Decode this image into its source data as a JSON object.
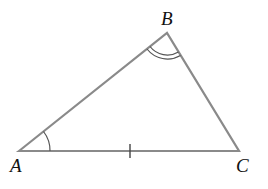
{
  "diagram": {
    "type": "triangle",
    "stroke_color": "#8a8a8a",
    "vertices": [
      {
        "label": "A",
        "x": 19,
        "y": 151
      },
      {
        "label": "B",
        "x": 167,
        "y": 33
      },
      {
        "label": "C",
        "x": 239,
        "y": 151
      }
    ],
    "markings": {
      "angle_A": "single arc",
      "angle_B": "double arc",
      "side_AC": "single tick"
    }
  }
}
